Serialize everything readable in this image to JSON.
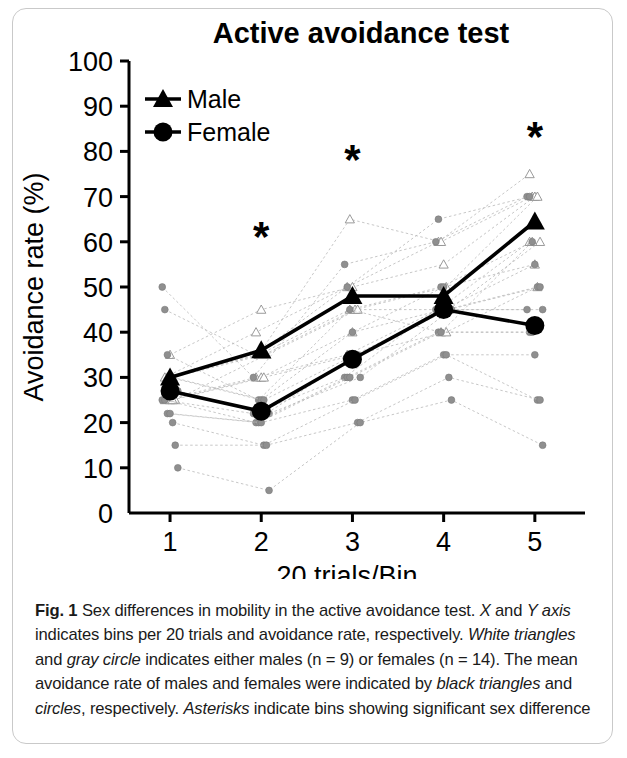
{
  "figure": {
    "label": "Fig. 1",
    "caption_parts": [
      {
        "text": "Fig. 1",
        "style": "bold"
      },
      {
        "text": " Sex differences in mobility in the active avoidance test. ",
        "style": "normal"
      },
      {
        "text": "X",
        "style": "italic"
      },
      {
        "text": " and ",
        "style": "normal"
      },
      {
        "text": "Y axis",
        "style": "italic"
      },
      {
        "text": " indicates bins per 20 trials and avoidance rate, respectively. ",
        "style": "normal"
      },
      {
        "text": "White triangles",
        "style": "italic"
      },
      {
        "text": " and ",
        "style": "normal"
      },
      {
        "text": "gray circle",
        "style": "italic"
      },
      {
        "text": " indicates either males (n = 9) or females (n = 14). The mean avoidance rate of males and females were indicated by ",
        "style": "normal"
      },
      {
        "text": "black triangles",
        "style": "italic"
      },
      {
        "text": " and ",
        "style": "normal"
      },
      {
        "text": "circles",
        "style": "italic"
      },
      {
        "text": ", respectively. ",
        "style": "normal"
      },
      {
        "text": "Asterisks",
        "style": "italic"
      },
      {
        "text": " indicate bins showing significant sex difference",
        "style": "normal"
      }
    ],
    "caption_plain": "Fig. 1 Sex differences in mobility in the active avoidance test. X and Y axis indicates bins per 20 trials and avoidance rate, respectively. White triangles and gray circle indicates either males (n = 9) or females (n = 14). The mean avoidance rate of males and females were indicated by black triangles and circles, respectively. Asterisks indicate bins showing significant sex difference"
  },
  "chart_data": {
    "type": "line",
    "title": "Active avoidance test",
    "xlabel": "20 trials/Bin",
    "ylabel": "Avoidance rate (%)",
    "x": [
      1,
      2,
      3,
      4,
      5
    ],
    "xtick_labels": [
      "1",
      "2",
      "3",
      "4",
      "5"
    ],
    "xlim": [
      0.55,
      5.55
    ],
    "ylim": [
      0,
      100
    ],
    "ytick_labels": [
      "0",
      "10",
      "20",
      "30",
      "40",
      "50",
      "60",
      "70",
      "80",
      "90",
      "100"
    ],
    "yticks": [
      0,
      10,
      20,
      30,
      40,
      50,
      60,
      70,
      80,
      90,
      100
    ],
    "grid": false,
    "legend_position": "top-left-inside",
    "series": [
      {
        "name": "Male",
        "marker": "triangle",
        "color": "#000000",
        "n": 9,
        "values": [
          30,
          36,
          48,
          48,
          64.5
        ],
        "label": "Male"
      },
      {
        "name": "Female",
        "marker": "circle",
        "color": "#000000",
        "n": 14,
        "values": [
          27,
          22.5,
          34,
          45,
          41.5
        ],
        "label": "Female"
      }
    ],
    "individual_male": [
      [
        30,
        40,
        50,
        60,
        75
      ],
      [
        30,
        35,
        65,
        60,
        70
      ],
      [
        35,
        45,
        50,
        55,
        70
      ],
      [
        30,
        35,
        45,
        50,
        70
      ],
      [
        25,
        35,
        45,
        45,
        60
      ],
      [
        25,
        30,
        35,
        45,
        60
      ],
      [
        30,
        35,
        45,
        40,
        60
      ],
      [
        25,
        30,
        40,
        45,
        55
      ],
      [
        25,
        30,
        35,
        40,
        50
      ]
    ],
    "individual_female": [
      [
        50,
        30,
        55,
        60,
        70
      ],
      [
        45,
        35,
        50,
        65,
        70
      ],
      [
        35,
        25,
        45,
        50,
        60
      ],
      [
        30,
        25,
        40,
        50,
        55
      ],
      [
        30,
        25,
        35,
        45,
        50
      ],
      [
        27,
        22,
        35,
        45,
        50
      ],
      [
        27,
        22,
        30,
        45,
        45
      ],
      [
        25,
        22,
        30,
        45,
        45
      ],
      [
        25,
        20,
        30,
        40,
        40
      ],
      [
        22,
        20,
        30,
        40,
        40
      ],
      [
        22,
        20,
        25,
        35,
        35
      ],
      [
        20,
        15,
        25,
        35,
        25
      ],
      [
        15,
        15,
        20,
        30,
        25
      ],
      [
        10,
        5,
        20,
        25,
        15
      ]
    ],
    "annotations": [
      {
        "text": "*",
        "x": 2,
        "y": 58,
        "name": "significance-asterisk-bin2"
      },
      {
        "text": "*",
        "x": 3,
        "y": 75,
        "name": "significance-asterisk-bin3"
      },
      {
        "text": "*",
        "x": 5,
        "y": 80,
        "name": "significance-asterisk-bin5"
      }
    ]
  }
}
